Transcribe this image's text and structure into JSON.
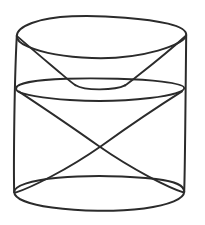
{
  "figure": {
    "title": "Cylinder with inscribed cone and funnel",
    "background_color": "#ffffff",
    "line_color": "#2b2b2b",
    "canvas": {
      "width": 205,
      "height": 225
    },
    "parts": [
      {
        "name": "top-rim-ellipse",
        "label": "Top rim of cylinder"
      },
      {
        "name": "middle-ellipse",
        "label": "Middle dividing ellipse"
      },
      {
        "name": "bottom-rim-ellipse",
        "label": "Bottom rim of cylinder"
      },
      {
        "name": "left-side-wall",
        "label": "Left side of cylinder"
      },
      {
        "name": "right-side-wall",
        "label": "Right side of cylinder"
      },
      {
        "name": "funnel-left-edge",
        "label": "Upper funnel left slant"
      },
      {
        "name": "funnel-right-edge",
        "label": "Upper funnel right slant"
      },
      {
        "name": "funnel-base-curve",
        "label": "Rounded bottom of funnel"
      },
      {
        "name": "cone-left-diagonal",
        "label": "Lower cone left diagonal"
      },
      {
        "name": "cone-right-diagonal",
        "label": "Lower cone right diagonal"
      }
    ],
    "geometry": {
      "top_ellipse": {
        "cx": 101.5,
        "cy": 35,
        "rx": 85,
        "ry": 19
      },
      "middle_ellipse": {
        "cx": 100,
        "cy": 89,
        "rx": 84,
        "ry": 12
      },
      "bottom_ellipse": {
        "cx": 99,
        "cy": 192,
        "rx": 85,
        "ry": 17
      },
      "x_crossing_point": {
        "x": 100,
        "y": 113
      },
      "funnel_apex": {
        "x": 100,
        "y": 85
      }
    }
  }
}
